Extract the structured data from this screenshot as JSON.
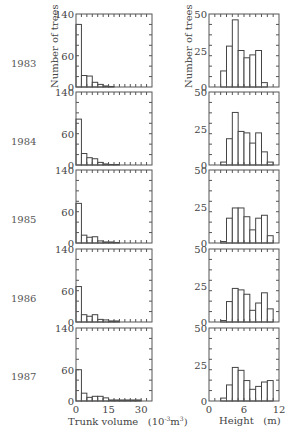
{
  "chart_data": [
    {
      "type": "bar",
      "title": "1983",
      "panel": "trunk-volume",
      "xlabel": "Trunk volume (10^-3 m^3)",
      "ylabel": "Number of trees",
      "ylim": [
        0,
        140
      ],
      "xlim": [
        0,
        35
      ],
      "yticks": [
        "0",
        "60",
        "140"
      ],
      "bin_width": 2.5,
      "values": [
        120,
        22,
        21,
        9,
        5,
        2,
        1,
        0,
        0,
        0,
        0,
        0,
        0,
        0
      ]
    },
    {
      "type": "bar",
      "title": "1984",
      "panel": "trunk-volume",
      "xlabel": "Trunk volume (10^-3 m^3)",
      "ylabel": "Number of trees",
      "ylim": [
        0,
        140
      ],
      "xlim": [
        0,
        35
      ],
      "yticks": [
        "0",
        "60",
        "140"
      ],
      "bin_width": 2.5,
      "values": [
        88,
        22,
        14,
        12,
        5,
        2,
        1,
        1,
        0,
        0,
        0,
        0,
        0,
        0
      ]
    },
    {
      "type": "bar",
      "title": "1985",
      "panel": "trunk-volume",
      "xlabel": "Trunk volume (10^-3 m^3)",
      "ylabel": "Number of trees",
      "ylim": [
        0,
        140
      ],
      "xlim": [
        0,
        35
      ],
      "yticks": [
        "0",
        "60",
        "140"
      ],
      "bin_width": 2.5,
      "values": [
        76,
        15,
        11,
        12,
        4,
        2,
        2,
        1,
        0,
        0,
        0,
        0,
        0,
        0
      ]
    },
    {
      "type": "bar",
      "title": "1986",
      "panel": "trunk-volume",
      "xlabel": "Trunk volume (10^-3 m^3)",
      "ylabel": "Number of trees",
      "ylim": [
        0,
        140
      ],
      "xlim": [
        0,
        35
      ],
      "yticks": [
        "0",
        "60",
        "140"
      ],
      "bin_width": 2.5,
      "values": [
        68,
        14,
        11,
        14,
        5,
        4,
        2,
        2,
        0,
        0,
        0,
        0,
        0,
        0
      ]
    },
    {
      "type": "bar",
      "title": "1987",
      "panel": "trunk-volume",
      "xlabel": "Trunk volume (10^-3 m^3)",
      "ylabel": "Number of trees",
      "ylim": [
        0,
        140
      ],
      "xlim": [
        0,
        35
      ],
      "xticks": [
        "0",
        "15",
        "30"
      ],
      "yticks": [
        "0",
        "60",
        "140"
      ],
      "bin_width": 2.5,
      "values": [
        60,
        15,
        7,
        9,
        9,
        6,
        2,
        2,
        2,
        2,
        2,
        2,
        0,
        0
      ]
    },
    {
      "type": "bar",
      "title": "1983",
      "panel": "height",
      "xlabel": "Height (m)",
      "ylabel": "Number of trees",
      "ylim": [
        0,
        50
      ],
      "xlim": [
        0,
        12
      ],
      "yticks": [
        "0",
        "25",
        "50"
      ],
      "bin_width": 1,
      "values": [
        0,
        0,
        11,
        28,
        46,
        25,
        20,
        22,
        25,
        3,
        0,
        0
      ]
    },
    {
      "type": "bar",
      "title": "1984",
      "panel": "height",
      "xlabel": "Height (m)",
      "ylabel": "Number of trees",
      "ylim": [
        0,
        50
      ],
      "xlim": [
        0,
        12
      ],
      "yticks": [
        "0",
        "25",
        "50"
      ],
      "bin_width": 1,
      "values": [
        0,
        0,
        2,
        18,
        36,
        23,
        22,
        15,
        22,
        9,
        2,
        0
      ]
    },
    {
      "type": "bar",
      "title": "1985",
      "panel": "height",
      "xlabel": "Height (m)",
      "ylabel": "Number of trees",
      "ylim": [
        0,
        50
      ],
      "xlim": [
        0,
        12
      ],
      "yticks": [
        "0",
        "25",
        "50"
      ],
      "bin_width": 1,
      "values": [
        0,
        0,
        1,
        17,
        24,
        24,
        18,
        9,
        17,
        19,
        5,
        0
      ]
    },
    {
      "type": "bar",
      "title": "1986",
      "panel": "height",
      "xlabel": "Height (m)",
      "ylabel": "Number of trees",
      "ylim": [
        0,
        50
      ],
      "xlim": [
        0,
        12
      ],
      "yticks": [
        "0",
        "25",
        "50"
      ],
      "bin_width": 1,
      "values": [
        0,
        0,
        1,
        14,
        23,
        22,
        19,
        8,
        13,
        20,
        9,
        0
      ]
    },
    {
      "type": "bar",
      "title": "1987",
      "panel": "height",
      "xlabel": "Height (m)",
      "ylabel": "Number of trees",
      "ylim": [
        0,
        50
      ],
      "xlim": [
        0,
        12
      ],
      "xticks": [
        "0",
        "6",
        "12"
      ],
      "yticks": [
        "0",
        "25",
        "50"
      ],
      "bin_width": 1,
      "values": [
        0,
        0,
        2,
        11,
        23,
        21,
        14,
        8,
        10,
        13,
        14,
        0
      ]
    }
  ],
  "labels": {
    "years": [
      "1983",
      "1984",
      "1985",
      "1986",
      "1987"
    ],
    "left_ylabel": "Number of trees",
    "right_ylabel": "Number of trees",
    "left_xlabel_main": "Trunk volume",
    "left_xlabel_unit_base": "(10",
    "left_xlabel_unit_exp": "-3",
    "left_xlabel_unit_m": "m",
    "left_xlabel_unit_exp2": "3",
    "left_xlabel_unit_close": ")",
    "right_xlabel_main": "Height",
    "right_xlabel_unit": "(m)",
    "left_xticks": [
      "0",
      "15",
      "30"
    ],
    "right_xticks": [
      "0",
      "6",
      "12"
    ]
  },
  "colors": {
    "axis": "#555555",
    "bar_stroke": "#444444",
    "bar_fill": "#ffffff",
    "text": "#444444"
  }
}
